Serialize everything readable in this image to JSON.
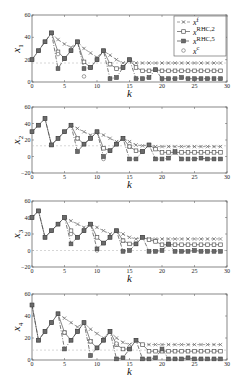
{
  "chart_data": [
    {
      "type": "line",
      "title": "",
      "xlabel": "k",
      "ylabel": "x_1",
      "xlim": [
        0,
        30
      ],
      "ylim": [
        0,
        60
      ],
      "yticks": [
        0,
        20,
        40,
        60
      ],
      "xticks": [
        0,
        5,
        10,
        15,
        20,
        25,
        30
      ],
      "grid": false,
      "legend_position": "upper right",
      "legend": [
        "x^f",
        "x^RHC,2",
        "x^RHC,5",
        "x^c"
      ],
      "reference_line": 17,
      "series": [
        {
          "name": "x^RHC,2",
          "x": [
            0,
            1,
            2,
            3,
            4,
            5,
            6,
            7,
            8,
            9,
            10,
            11,
            12,
            13,
            14,
            15,
            16,
            17,
            18,
            19,
            20,
            21,
            22,
            23,
            24,
            25,
            26,
            27,
            28,
            29
          ],
          "y": [
            20,
            28,
            36,
            44,
            27,
            21,
            28,
            36,
            18,
            13,
            20,
            28,
            16,
            12,
            13,
            20,
            13,
            10,
            10,
            11,
            10,
            10,
            10,
            10,
            10,
            10,
            10,
            10,
            10,
            10
          ]
        },
        {
          "name": "x^f",
          "x": [
            3,
            4,
            5,
            6,
            7,
            8,
            9,
            10,
            11,
            12,
            13,
            14,
            15,
            16,
            17,
            18,
            19,
            20,
            21,
            22,
            23,
            24,
            25,
            26,
            27,
            28,
            29
          ],
          "y": [
            44,
            38,
            34,
            31,
            36,
            30,
            26,
            22,
            28,
            24,
            20,
            17,
            20,
            17,
            17,
            17,
            17,
            17,
            17,
            17,
            17,
            17,
            17,
            17,
            17,
            17,
            17
          ]
        },
        {
          "name": "x^RHC,5",
          "x": [
            0,
            1,
            2,
            3,
            4,
            5,
            6,
            7,
            8,
            9,
            10,
            11,
            12,
            13,
            14,
            15,
            16,
            17,
            18,
            19,
            20,
            21,
            22,
            23,
            24,
            25,
            26,
            27,
            28,
            29
          ],
          "y": [
            20,
            28,
            36,
            44,
            12,
            21,
            28,
            36,
            12,
            13,
            20,
            28,
            3,
            4,
            13,
            20,
            3,
            3,
            4,
            11,
            3,
            3,
            3,
            4,
            3,
            3,
            3,
            3,
            3,
            3
          ]
        },
        {
          "name": "x^c",
          "x": [
            4,
            8,
            12
          ],
          "y": [
            25,
            5,
            16
          ]
        }
      ]
    },
    {
      "type": "line",
      "xlabel": "k",
      "ylabel": "x_2",
      "xlim": [
        0,
        30
      ],
      "ylim": [
        -20,
        60
      ],
      "yticks": [
        -20,
        0,
        20,
        40,
        60
      ],
      "xticks": [
        0,
        5,
        10,
        15,
        20,
        25,
        30
      ],
      "reference_line": 13,
      "series": [
        {
          "name": "x^RHC,2",
          "x": [
            0,
            1,
            2,
            3,
            4,
            5,
            6,
            7,
            8,
            9,
            10,
            11,
            12,
            13,
            14,
            15,
            16,
            17,
            18,
            19,
            20,
            21,
            22,
            23,
            24,
            25,
            26,
            27,
            28,
            29
          ],
          "y": [
            30,
            38,
            46,
            14,
            22,
            30,
            38,
            22,
            15,
            22,
            30,
            10,
            7,
            15,
            22,
            12,
            7,
            6,
            14,
            9,
            5,
            5,
            5,
            5,
            5,
            5,
            5,
            5,
            5,
            5
          ]
        },
        {
          "name": "x^f",
          "x": [
            6,
            7,
            8,
            9,
            10,
            11,
            12,
            13,
            14,
            15,
            16,
            17,
            18,
            19,
            20,
            21,
            22,
            23,
            24,
            25,
            26,
            27,
            28,
            29
          ],
          "y": [
            38,
            34,
            30,
            26,
            30,
            26,
            22,
            18,
            22,
            18,
            14,
            13,
            14,
            12,
            12,
            12,
            12,
            12,
            12,
            12,
            12,
            12,
            12,
            12
          ]
        },
        {
          "name": "x^RHC,5",
          "x": [
            0,
            1,
            2,
            3,
            4,
            5,
            6,
            7,
            8,
            9,
            10,
            11,
            12,
            13,
            14,
            15,
            16,
            17,
            18,
            19,
            20,
            21,
            22,
            23,
            24,
            25,
            26,
            27,
            28,
            29
          ],
          "y": [
            30,
            38,
            46,
            14,
            22,
            30,
            38,
            6,
            15,
            22,
            30,
            0,
            7,
            15,
            22,
            -3,
            -3,
            6,
            14,
            -3,
            -3,
            -2,
            6,
            -3,
            -3,
            -3,
            -2,
            -3,
            -3,
            -3
          ]
        },
        {
          "name": "x^c",
          "x": [
            7,
            11,
            15
          ],
          "y": [
            22,
            -3,
            12
          ]
        }
      ]
    },
    {
      "type": "line",
      "xlabel": "k",
      "ylabel": "x_3",
      "xlim": [
        0,
        30
      ],
      "ylim": [
        -20,
        60
      ],
      "yticks": [
        -20,
        0,
        20,
        40,
        60
      ],
      "xticks": [
        0,
        5,
        10,
        15,
        20,
        25,
        30
      ],
      "reference_line": 0,
      "series": [
        {
          "name": "x^RHC,2",
          "x": [
            0,
            1,
            2,
            3,
            4,
            5,
            6,
            7,
            8,
            9,
            10,
            11,
            12,
            13,
            14,
            15,
            16,
            17,
            18,
            19,
            20,
            21,
            22,
            23,
            24,
            25,
            26,
            27,
            28,
            29
          ],
          "y": [
            40,
            48,
            16,
            24,
            32,
            40,
            24,
            16,
            24,
            32,
            16,
            9,
            16,
            24,
            12,
            8,
            8,
            16,
            13,
            11,
            7,
            7,
            7,
            7,
            7,
            7,
            7,
            7,
            7,
            7
          ]
        },
        {
          "name": "x^f",
          "x": [
            5,
            6,
            7,
            8,
            9,
            10,
            11,
            12,
            13,
            14,
            15,
            16,
            17,
            18,
            19,
            20,
            21,
            22,
            23,
            24,
            25,
            26,
            27,
            28,
            29
          ],
          "y": [
            40,
            36,
            32,
            28,
            32,
            28,
            24,
            20,
            24,
            20,
            16,
            14,
            16,
            14,
            14,
            14,
            14,
            14,
            14,
            14,
            14,
            14,
            14,
            14,
            14
          ]
        },
        {
          "name": "x^RHC,5",
          "x": [
            0,
            1,
            2,
            3,
            4,
            5,
            6,
            7,
            8,
            9,
            10,
            11,
            12,
            13,
            14,
            15,
            16,
            17,
            18,
            19,
            20,
            21,
            22,
            23,
            24,
            25,
            26,
            27,
            28,
            29
          ],
          "y": [
            40,
            48,
            16,
            24,
            32,
            40,
            8,
            16,
            24,
            32,
            2,
            9,
            16,
            24,
            -1,
            0,
            8,
            16,
            -1,
            -1,
            0,
            8,
            -1,
            -1,
            -1,
            0,
            -1,
            -1,
            -1,
            -1
          ]
        },
        {
          "name": "x^c",
          "x": [
            6,
            10,
            14
          ],
          "y": [
            20,
            0,
            12
          ]
        }
      ]
    },
    {
      "type": "line",
      "xlabel": "k",
      "ylabel": "x_4",
      "xlim": [
        0,
        30
      ],
      "ylim": [
        0,
        60
      ],
      "yticks": [
        0,
        20,
        40,
        60
      ],
      "xticks": [
        0,
        5,
        10,
        15,
        20,
        25,
        30
      ],
      "reference_line": 9,
      "series": [
        {
          "name": "x^RHC,2",
          "x": [
            0,
            1,
            2,
            3,
            4,
            5,
            6,
            7,
            8,
            9,
            10,
            11,
            12,
            13,
            14,
            15,
            16,
            17,
            18,
            19,
            20,
            21,
            22,
            23,
            24,
            25,
            26,
            27,
            28,
            29
          ],
          "y": [
            50,
            18,
            26,
            34,
            42,
            25,
            18,
            26,
            34,
            17,
            11,
            18,
            26,
            14,
            10,
            10,
            18,
            14,
            8,
            8,
            8,
            8,
            8,
            8,
            8,
            8,
            8,
            8,
            8,
            8
          ]
        },
        {
          "name": "x^f",
          "x": [
            4,
            5,
            6,
            7,
            8,
            9,
            10,
            11,
            12,
            13,
            14,
            15,
            16,
            17,
            18,
            19,
            20,
            21,
            22,
            23,
            24,
            25,
            26,
            27,
            28,
            29
          ],
          "y": [
            42,
            38,
            34,
            30,
            34,
            28,
            24,
            20,
            26,
            20,
            16,
            14,
            18,
            14,
            14,
            14,
            14,
            14,
            14,
            14,
            14,
            14,
            14,
            14,
            14,
            14
          ]
        },
        {
          "name": "x^RHC,5",
          "x": [
            0,
            1,
            2,
            3,
            4,
            5,
            6,
            7,
            8,
            9,
            10,
            11,
            12,
            13,
            14,
            15,
            16,
            17,
            18,
            19,
            20,
            21,
            22,
            23,
            24,
            25,
            26,
            27,
            28,
            29
          ],
          "y": [
            50,
            18,
            26,
            34,
            42,
            10,
            18,
            26,
            34,
            4,
            11,
            18,
            26,
            1,
            2,
            10,
            18,
            1,
            1,
            2,
            10,
            1,
            1,
            1,
            2,
            1,
            1,
            1,
            1,
            1
          ]
        },
        {
          "name": "x^c",
          "x": [
            5,
            9,
            13
          ],
          "y": [
            25,
            17,
            15
          ]
        }
      ]
    }
  ],
  "labels": {
    "xlabel": "k",
    "ylabels": [
      "x",
      "x",
      "x",
      "x"
    ],
    "ysubs": [
      "1",
      "2",
      "3",
      "4"
    ],
    "legend": [
      {
        "base": "x",
        "sup": "f"
      },
      {
        "base": "x",
        "sup": "RHC,2"
      },
      {
        "base": "x",
        "sup": "RHC,5"
      },
      {
        "base": "x",
        "sup": "c"
      }
    ]
  }
}
